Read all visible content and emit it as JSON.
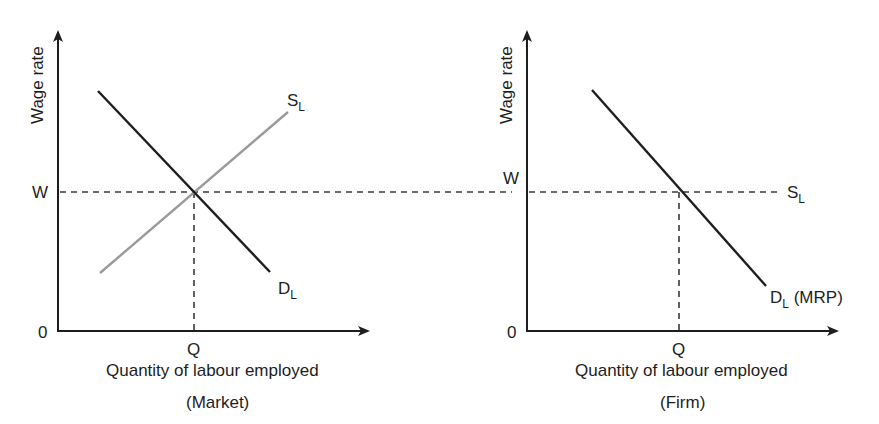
{
  "diagram": {
    "colors": {
      "axis": "#1e1e1e",
      "demand": "#1e1e1e",
      "supply_market": "#9a9a9a",
      "dashed": "#3a3a3a",
      "background": "#ffffff"
    },
    "panels": [
      {
        "id": "market",
        "y_axis_label": "Wage rate",
        "x_axis_label": "Quantity of labour employed",
        "caption": "(Market)",
        "origin_label": "0",
        "w_label": "W",
        "q_label": "Q",
        "supply": {
          "main": "S",
          "sub": "L"
        },
        "demand": {
          "main": "D",
          "sub": "L",
          "suffix": ""
        }
      },
      {
        "id": "firm",
        "y_axis_label": "Wage rate",
        "x_axis_label": "Quantity of labour employed",
        "caption": "(Firm)",
        "origin_label": "0",
        "w_label": "W",
        "q_label": "Q",
        "supply": {
          "main": "S",
          "sub": "L"
        },
        "demand": {
          "main": "D",
          "sub": "L",
          "suffix": " (MRP)"
        }
      }
    ]
  }
}
